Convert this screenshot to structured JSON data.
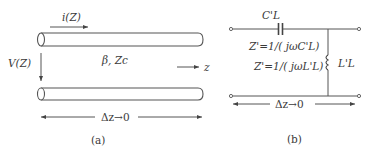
{
  "panel_a": {
    "current_label": "i(Z)",
    "voltage_label": "V(Z)",
    "params_label": "β,  Zc",
    "axis_label": "z",
    "length_label": "Δz→0",
    "caption": "(a)"
  },
  "panel_b": {
    "capacitor_label": "C'L",
    "inductor_label": "L'L",
    "impedance_c": "Z'=1/( jωC'L)",
    "impedance_l": "Z'=1/( jωL'L)",
    "length_label": "Δz→0",
    "caption": "(b)"
  },
  "colors": {
    "line": "#555555",
    "text": "#3a3a3a"
  }
}
